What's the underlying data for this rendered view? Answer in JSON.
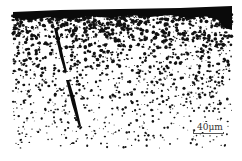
{
  "image": {
    "kind": "micrograph",
    "description": "Cross-section micrograph showing dark porosity speckles denser near the top surface and a diagonal crack",
    "colors": {
      "background": "#ffffff",
      "features": "#111111",
      "surface_band": "#0a0a0a"
    }
  },
  "scale_bar": {
    "label": "40μm"
  }
}
